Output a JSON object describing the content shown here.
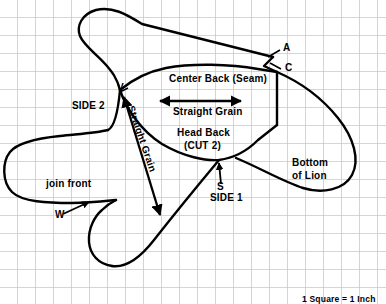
{
  "diagram": {
    "scale_note": "1 Square = 1 Inch",
    "grid": {
      "square_px": 18,
      "line_color": "#c9c9c9",
      "background_color": "#ffffff"
    },
    "outline_color": "#000000",
    "labels": {
      "center_back_seam": "Center Back (Seam)",
      "straight_grain_horizontal": "Straight Grain",
      "straight_grain_diagonal": "Straight Grain",
      "head_back": "Head Back",
      "cut_count": "(CUT 2)",
      "side_1": "SIDE 1",
      "side_2": "SIDE 2",
      "bottom_of_lion_line1": "Bottom",
      "bottom_of_lion_line2": "of Lion",
      "join_front": "join front",
      "point_a": "A",
      "point_c": "C",
      "point_v": "V",
      "point_s": "S",
      "point_w": "W"
    }
  }
}
